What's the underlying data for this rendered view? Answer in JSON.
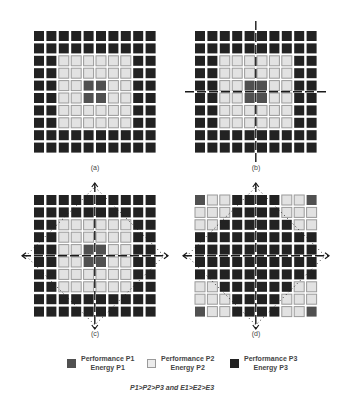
{
  "figure": {
    "grid_size": 10,
    "colors": {
      "P1": "#505050",
      "P2": "#e2e2e2",
      "P2_border": "#9a9a9a",
      "P3": "#222222",
      "line": "#1a1a1a"
    },
    "panels": [
      {
        "id": "a",
        "label": "(a)",
        "pattern": [
          "3333333333",
          "3333333333",
          "3322222233",
          "3322222233",
          "3322112233",
          "3322112233",
          "3322222233",
          "3322222233",
          "3333333333",
          "3333333333"
        ],
        "cuts": "none"
      },
      {
        "id": "b",
        "label": "(b)",
        "pattern": [
          "3333333333",
          "3333333333",
          "3322222233",
          "3322222233",
          "3322112233",
          "3322112233",
          "3322222233",
          "3322222233",
          "3333333333",
          "3333333333"
        ],
        "cuts": "cross"
      },
      {
        "id": "c",
        "label": "(c)",
        "pattern": [
          "3333333333",
          "3333333333",
          "3322222233",
          "3322222233",
          "3322112233",
          "3322112233",
          "3322222233",
          "3322222233",
          "3333333333",
          "3333333333"
        ],
        "cuts": "cross-diamond"
      },
      {
        "id": "d",
        "label": "(d)",
        "pattern": [
          "1223333221",
          "2223333222",
          "2233333322",
          "3333333333",
          "3333333333",
          "3333333333",
          "3333333333",
          "2233333322",
          "2223333222",
          "1223333221"
        ],
        "cuts": "cross-diamond"
      }
    ]
  },
  "legend": {
    "items": [
      {
        "performance": "Performance P1",
        "energy": "Energy P1",
        "level": "P1"
      },
      {
        "performance": "Performance P2",
        "energy": "Energy P2",
        "level": "P2"
      },
      {
        "performance": "Performance P3",
        "energy": "Energy P3",
        "level": "P3"
      }
    ],
    "footnote": "P1>P2>P3 and E1>E2>E3"
  }
}
